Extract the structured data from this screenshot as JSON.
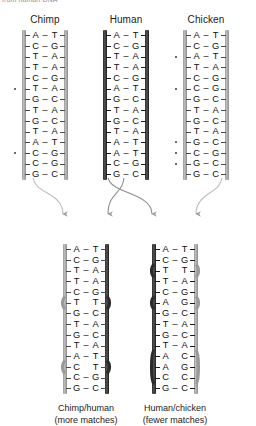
{
  "figure": {
    "top_caption": "from human DNA",
    "columns": [
      {
        "id": "chimp",
        "label": "Chimp",
        "strand_style": "gray",
        "pairs": [
          {
            "left": "A",
            "bond": "–",
            "right": "T",
            "mismatch": false
          },
          {
            "left": "C",
            "bond": "–",
            "right": "G",
            "mismatch": false
          },
          {
            "left": "T",
            "bond": "–",
            "right": "A",
            "mismatch": false
          },
          {
            "left": "T",
            "bond": "–",
            "right": "A",
            "mismatch": false
          },
          {
            "left": "C",
            "bond": "–",
            "right": "G",
            "mismatch": false
          },
          {
            "left": "T",
            "bond": "–",
            "right": "A",
            "mismatch": true
          },
          {
            "left": "G",
            "bond": "–",
            "right": "C",
            "mismatch": false
          },
          {
            "left": "T",
            "bond": "–",
            "right": "A",
            "mismatch": false
          },
          {
            "left": "G",
            "bond": "–",
            "right": "C",
            "mismatch": false
          },
          {
            "left": "T",
            "bond": "–",
            "right": "A",
            "mismatch": false
          },
          {
            "left": "A",
            "bond": "–",
            "right": "T",
            "mismatch": false
          },
          {
            "left": "C",
            "bond": "–",
            "right": "G",
            "mismatch": true
          },
          {
            "left": "C",
            "bond": "–",
            "right": "G",
            "mismatch": false
          },
          {
            "left": "G",
            "bond": "–",
            "right": "C",
            "mismatch": false
          }
        ]
      },
      {
        "id": "human",
        "label": "Human",
        "strand_style": "dark",
        "pairs": [
          {
            "left": "A",
            "bond": "–",
            "right": "T",
            "mismatch": false
          },
          {
            "left": "C",
            "bond": "–",
            "right": "G",
            "mismatch": false
          },
          {
            "left": "T",
            "bond": "–",
            "right": "A",
            "mismatch": false
          },
          {
            "left": "T",
            "bond": "–",
            "right": "A",
            "mismatch": false
          },
          {
            "left": "C",
            "bond": "–",
            "right": "G",
            "mismatch": false
          },
          {
            "left": "A",
            "bond": "–",
            "right": "T",
            "mismatch": false
          },
          {
            "left": "G",
            "bond": "–",
            "right": "C",
            "mismatch": false
          },
          {
            "left": "T",
            "bond": "–",
            "right": "A",
            "mismatch": false
          },
          {
            "left": "G",
            "bond": "–",
            "right": "C",
            "mismatch": false
          },
          {
            "left": "T",
            "bond": "–",
            "right": "A",
            "mismatch": false
          },
          {
            "left": "A",
            "bond": "–",
            "right": "T",
            "mismatch": false
          },
          {
            "left": "A",
            "bond": "–",
            "right": "T",
            "mismatch": false
          },
          {
            "left": "C",
            "bond": "–",
            "right": "G",
            "mismatch": false
          },
          {
            "left": "G",
            "bond": "–",
            "right": "C",
            "mismatch": false
          }
        ]
      },
      {
        "id": "chicken",
        "label": "Chicken",
        "strand_style": "gray",
        "pairs": [
          {
            "left": "A",
            "bond": "–",
            "right": "T",
            "mismatch": false
          },
          {
            "left": "C",
            "bond": "–",
            "right": "G",
            "mismatch": false
          },
          {
            "left": "A",
            "bond": "–",
            "right": "T",
            "mismatch": true
          },
          {
            "left": "T",
            "bond": "–",
            "right": "A",
            "mismatch": false
          },
          {
            "left": "C",
            "bond": "–",
            "right": "G",
            "mismatch": false
          },
          {
            "left": "C",
            "bond": "–",
            "right": "G",
            "mismatch": true
          },
          {
            "left": "G",
            "bond": "–",
            "right": "C",
            "mismatch": false
          },
          {
            "left": "T",
            "bond": "–",
            "right": "A",
            "mismatch": false
          },
          {
            "left": "G",
            "bond": "–",
            "right": "C",
            "mismatch": false
          },
          {
            "left": "T",
            "bond": "–",
            "right": "A",
            "mismatch": false
          },
          {
            "left": "G",
            "bond": "–",
            "right": "C",
            "mismatch": true
          },
          {
            "left": "C",
            "bond": "–",
            "right": "G",
            "mismatch": true
          },
          {
            "left": "G",
            "bond": "–",
            "right": "C",
            "mismatch": true
          },
          {
            "left": "G",
            "bond": "–",
            "right": "C",
            "mismatch": false
          }
        ]
      }
    ],
    "hybrids": [
      {
        "id": "chimp-human",
        "label_line1": "Chimp/human",
        "label_line2": "(more matches)",
        "left_strand_style": "gray",
        "right_strand_style": "dark",
        "pairs": [
          {
            "left": "A",
            "bond": "–",
            "right": "T",
            "mismatch": false
          },
          {
            "left": "C",
            "bond": "–",
            "right": "G",
            "mismatch": false
          },
          {
            "left": "T",
            "bond": "–",
            "right": "A",
            "mismatch": false
          },
          {
            "left": "T",
            "bond": "–",
            "right": "A",
            "mismatch": false
          },
          {
            "left": "C",
            "bond": "–",
            "right": "G",
            "mismatch": false
          },
          {
            "left": "T",
            "bond": "",
            "right": "T",
            "mismatch": true
          },
          {
            "left": "G",
            "bond": "–",
            "right": "C",
            "mismatch": false
          },
          {
            "left": "T",
            "bond": "–",
            "right": "A",
            "mismatch": false
          },
          {
            "left": "G",
            "bond": "–",
            "right": "C",
            "mismatch": false
          },
          {
            "left": "T",
            "bond": "–",
            "right": "A",
            "mismatch": false
          },
          {
            "left": "A",
            "bond": "–",
            "right": "T",
            "mismatch": false
          },
          {
            "left": "C",
            "bond": "",
            "right": "T",
            "mismatch": true
          },
          {
            "left": "C",
            "bond": "–",
            "right": "G",
            "mismatch": false
          },
          {
            "left": "G",
            "bond": "–",
            "right": "C",
            "mismatch": false
          }
        ]
      },
      {
        "id": "human-chicken",
        "label_line1": "Human/chicken",
        "label_line2": "(fewer matches)",
        "left_strand_style": "dark",
        "right_strand_style": "gray",
        "pairs": [
          {
            "left": "A",
            "bond": "–",
            "right": "T",
            "mismatch": false
          },
          {
            "left": "C",
            "bond": "–",
            "right": "G",
            "mismatch": false
          },
          {
            "left": "T",
            "bond": "",
            "right": "T",
            "mismatch": true
          },
          {
            "left": "T",
            "bond": "–",
            "right": "A",
            "mismatch": false
          },
          {
            "left": "C",
            "bond": "–",
            "right": "G",
            "mismatch": false
          },
          {
            "left": "A",
            "bond": "",
            "right": "G",
            "mismatch": true
          },
          {
            "left": "G",
            "bond": "–",
            "right": "C",
            "mismatch": false
          },
          {
            "left": "T",
            "bond": "–",
            "right": "A",
            "mismatch": false
          },
          {
            "left": "G",
            "bond": "–",
            "right": "C",
            "mismatch": false
          },
          {
            "left": "T",
            "bond": "–",
            "right": "A",
            "mismatch": false
          },
          {
            "left": "A",
            "bond": "",
            "right": "C",
            "mismatch": true
          },
          {
            "left": "A",
            "bond": "",
            "right": "G",
            "mismatch": true
          },
          {
            "left": "C",
            "bond": "",
            "right": "C",
            "mismatch": true
          },
          {
            "left": "G",
            "bond": "–",
            "right": "C",
            "mismatch": false
          }
        ]
      }
    ],
    "arrows": [
      {
        "id": "chimp-to-left",
        "from": "chimp",
        "to": "chimp-human"
      },
      {
        "id": "human-to-left",
        "from": "human",
        "to": "chimp-human"
      },
      {
        "id": "human-to-right",
        "from": "human",
        "to": "human-chicken"
      },
      {
        "id": "chicken-to-right",
        "from": "chicken",
        "to": "human-chicken"
      }
    ],
    "colors": {
      "strand_gray": "#9a9a9a",
      "strand_dark": "#262626",
      "arrow": "#9e9e9e",
      "text": "#1b1b1b",
      "mismatch_dot": "#3a3a3a"
    }
  }
}
